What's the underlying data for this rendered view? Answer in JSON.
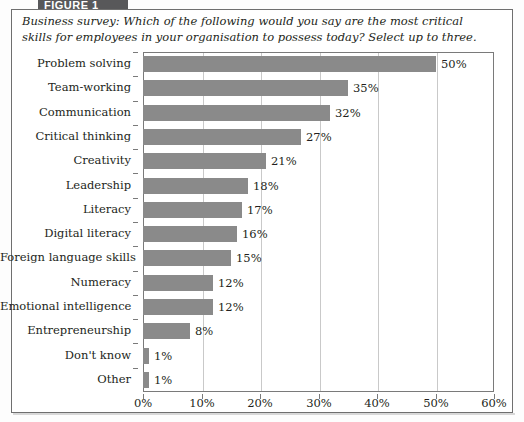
{
  "banner": {
    "label": "FIGURE 1"
  },
  "title": "Business survey: Which of the following would you say are the most critical skills for employees in your organisation to possess today? Select up to three.",
  "colors": {
    "bar": "#8a8a8a",
    "frame": "#6f6f6f",
    "grid": "#c9c9c9",
    "banner": "#58585a",
    "text": "#231f20"
  },
  "chart_data": {
    "type": "bar",
    "orientation": "horizontal",
    "title": "Business survey: Which of the following would you say are the most critical skills for employees in your organisation to possess today? Select up to three.",
    "xlabel": "",
    "ylabel": "",
    "xlim": [
      0,
      60
    ],
    "grid": true,
    "legend": false,
    "value_suffix": "%",
    "xticks": [
      0,
      10,
      20,
      30,
      40,
      50,
      60
    ],
    "xticklabels": [
      "0%",
      "10%",
      "20%",
      "30%",
      "40%",
      "50%",
      "60%"
    ],
    "categories": [
      "Problem solving",
      "Team-working",
      "Communication",
      "Critical thinking",
      "Creativity",
      "Leadership",
      "Literacy",
      "Digital literacy",
      "Foreign language skills",
      "Numeracy",
      "Emotional intelligence",
      "Entrepreneurship",
      "Don't know",
      "Other"
    ],
    "values": [
      50,
      35,
      32,
      27,
      21,
      18,
      17,
      16,
      15,
      12,
      12,
      8,
      1,
      1
    ],
    "data_labels": [
      "50%",
      "35%",
      "32%",
      "27%",
      "21%",
      "18%",
      "17%",
      "16%",
      "15%",
      "12%",
      "12%",
      "8%",
      "1%",
      "1%"
    ]
  }
}
